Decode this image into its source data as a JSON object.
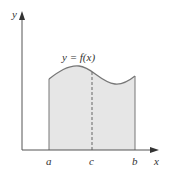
{
  "diagram": {
    "curve_label": "y = f(x)",
    "axes": {
      "x_label": "x",
      "y_label": "y"
    },
    "points": {
      "a": "a",
      "b": "b",
      "c": "c"
    },
    "colors": {
      "axis": "#555555",
      "curve": "#777777",
      "fill": "#e6e6e6",
      "dashed": "#666666",
      "text": "#333333",
      "background": "#ffffff"
    }
  }
}
